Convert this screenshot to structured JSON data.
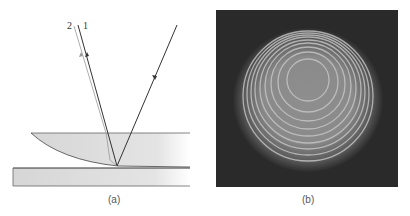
{
  "panel_a": {
    "caption": "(a)",
    "ray_labels": [
      "2",
      "1"
    ]
  },
  "panel_b": {
    "caption": "(b)"
  },
  "colors": {
    "glass": "#dcdcdc",
    "line": "#333333",
    "background_b": "#2a2a2a"
  }
}
